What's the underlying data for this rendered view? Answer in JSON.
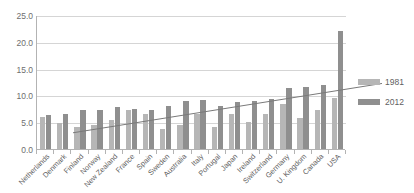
{
  "chart_data": {
    "type": "bar",
    "title": "",
    "subtitle": "",
    "xlabel": "",
    "ylabel": "",
    "ylim": [
      0.0,
      25.0
    ],
    "ytick_labels": [
      "0.0",
      "5.0",
      "10.0",
      "15.0",
      "20.0",
      "25.0"
    ],
    "ytick_values": [
      0.0,
      5.0,
      10.0,
      15.0,
      20.0,
      25.0
    ],
    "grid": true,
    "legend_position": "right",
    "categories": [
      "Netherlands",
      "Denmark",
      "Finland",
      "Norway",
      "New Zealand",
      "France",
      "Spain",
      "Sweden",
      "Australia",
      "Italy",
      "Portugal",
      "Japan",
      "Ireland",
      "Switzerland",
      "Germany",
      "U. Kingdom",
      "Canada",
      "USA"
    ],
    "series": [
      {
        "name": "1981",
        "color": "#b6b6b6",
        "values": [
          6.0,
          4.8,
          4.2,
          4.5,
          5.4,
          7.2,
          6.5,
          3.7,
          4.5,
          6.5,
          4.2,
          6.5,
          5.0,
          6.5,
          8.4,
          5.8,
          7.3,
          9.5
        ]
      },
      {
        "name": "2012",
        "color": "#8f8f8f",
        "values": [
          6.4,
          6.6,
          7.2,
          7.3,
          7.8,
          7.5,
          7.3,
          8.1,
          9.0,
          9.2,
          8.1,
          8.7,
          9.0,
          9.4,
          11.3,
          11.6,
          11.9,
          22.0
        ]
      }
    ],
    "trendline": {
      "name": "trend",
      "color": "#7a7a7a",
      "start_value": 6.2,
      "end_value": 15.4
    }
  }
}
